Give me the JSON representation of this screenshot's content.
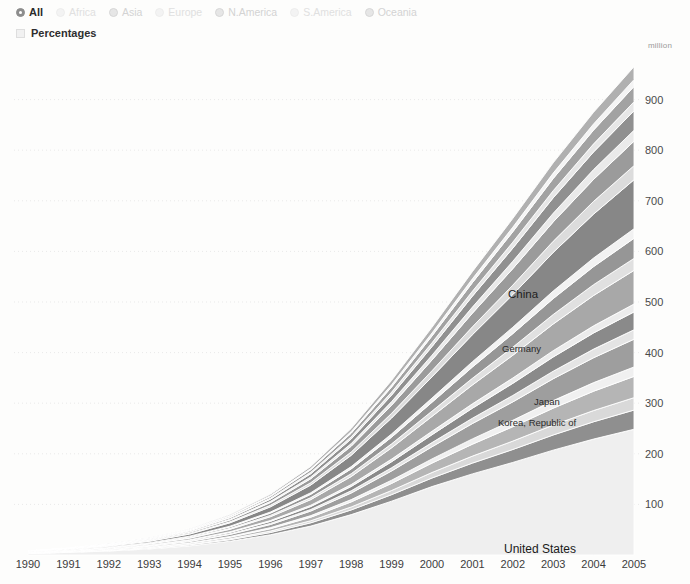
{
  "controls": {
    "regions": [
      {
        "label": "All",
        "selected": true
      },
      {
        "label": "Africa",
        "selected": false
      },
      {
        "label": "Asia",
        "selected": false
      },
      {
        "label": "Europe",
        "selected": false
      },
      {
        "label": "N.America",
        "selected": false
      },
      {
        "label": "S.America",
        "selected": false
      },
      {
        "label": "Oceania",
        "selected": false
      }
    ],
    "percentages": {
      "label": "Percentages",
      "checked": false,
      "icon": "checkbox-icon"
    }
  },
  "chart_data": {
    "type": "area",
    "stacked": true,
    "title": "",
    "xlabel": "",
    "ylabel": "",
    "unit_label": "million",
    "grid": true,
    "legend_position": "in-plot",
    "xlim": [
      1990,
      2005
    ],
    "ylim": [
      0,
      1000
    ],
    "yticks": [
      100,
      200,
      300,
      400,
      500,
      600,
      700,
      800,
      900
    ],
    "x": [
      1990,
      1991,
      1992,
      1993,
      1994,
      1995,
      1996,
      1997,
      1998,
      1999,
      2000,
      2001,
      2002,
      2003,
      2004,
      2005
    ],
    "xticklabels": [
      "1990",
      "1991",
      "1992",
      "1993",
      "1994",
      "1995",
      "1996",
      "1997",
      "1998",
      "1999",
      "2000",
      "2001",
      "2002",
      "2003",
      "2004",
      "2005"
    ],
    "total_values": [
      8,
      14,
      22,
      34,
      52,
      80,
      120,
      175,
      250,
      345,
      450,
      560,
      665,
      775,
      875,
      965
    ],
    "annotations": [
      {
        "text": "China",
        "x": 2002.4,
        "y": 610
      },
      {
        "text": "Germany",
        "x": 2002.2,
        "y": 505
      },
      {
        "text": "Japan",
        "x": 2003.0,
        "y": 403
      },
      {
        "text": "Korea, Republic of",
        "x": 2002.0,
        "y": 362
      },
      {
        "text": "United States",
        "x": 2002.2,
        "y": 115
      }
    ],
    "series": [
      {
        "name": "United States",
        "color": "#efefef",
        "values": [
          3.0,
          5.2,
          8.0,
          12.0,
          18.0,
          27.0,
          39.0,
          55.0,
          76.0,
          99.0,
          124.0,
          143.0,
          161.0,
          180.0,
          198.0,
          213.0
        ]
      },
      {
        "name": "Band-02",
        "color": "#8f8f8f",
        "values": [
          0.3,
          0.5,
          0.8,
          1.2,
          1.9,
          2.9,
          4.3,
          6.2,
          8.8,
          12.0,
          15.5,
          19.0,
          22.5,
          26.0,
          29.5,
          32.5
        ]
      },
      {
        "name": "Band-03",
        "color": "#d9d9d9",
        "values": [
          0.2,
          0.3,
          0.5,
          0.8,
          1.2,
          1.9,
          2.8,
          4.0,
          5.6,
          7.7,
          10.0,
          12.3,
          14.6,
          17.0,
          19.2,
          21.0
        ]
      },
      {
        "name": "Korea, Republic of",
        "color": "#b5b5b5",
        "values": [
          0.3,
          0.5,
          0.8,
          1.3,
          2.0,
          3.1,
          4.6,
          6.7,
          9.5,
          13.0,
          17.0,
          21.0,
          25.0,
          29.0,
          33.0,
          36.0
        ]
      },
      {
        "name": "Band-05",
        "color": "#f0f0f0",
        "values": [
          0.15,
          0.25,
          0.4,
          0.6,
          0.9,
          1.4,
          2.1,
          3.0,
          4.3,
          5.9,
          7.6,
          9.4,
          11.2,
          13.0,
          14.7,
          16.0
        ]
      },
      {
        "name": "Japan",
        "color": "#9e9e9e",
        "values": [
          0.4,
          0.7,
          1.1,
          1.7,
          2.6,
          4.0,
          6.0,
          8.7,
          12.4,
          17.0,
          22.0,
          27.0,
          32.0,
          37.5,
          42.5,
          47.0
        ]
      },
      {
        "name": "Band-07",
        "color": "#e4e4e4",
        "values": [
          0.15,
          0.25,
          0.4,
          0.6,
          0.9,
          1.4,
          2.1,
          3.0,
          4.3,
          5.9,
          7.6,
          9.4,
          11.2,
          13.0,
          14.7,
          16.0
        ]
      },
      {
        "name": "Band-08",
        "color": "#8a8a8a",
        "values": [
          0.25,
          0.45,
          0.7,
          1.1,
          1.7,
          2.6,
          3.9,
          5.6,
          8.0,
          11.0,
          14.2,
          17.6,
          21.0,
          24.4,
          27.6,
          30.2
        ]
      },
      {
        "name": "Band-09",
        "color": "#ececec",
        "values": [
          0.12,
          0.2,
          0.32,
          0.5,
          0.76,
          1.2,
          1.7,
          2.5,
          3.6,
          4.9,
          6.3,
          7.8,
          9.3,
          10.8,
          12.2,
          13.4
        ]
      },
      {
        "name": "Germany",
        "color": "#a8a8a8",
        "values": [
          0.5,
          0.85,
          1.35,
          2.1,
          3.2,
          4.9,
          7.3,
          10.6,
          15.1,
          20.7,
          26.9,
          33.2,
          39.5,
          45.8,
          51.8,
          57.0
        ]
      },
      {
        "name": "Band-11",
        "color": "#e0e0e0",
        "values": [
          0.18,
          0.3,
          0.48,
          0.75,
          1.14,
          1.75,
          2.6,
          3.8,
          5.4,
          7.4,
          9.6,
          11.8,
          14.1,
          16.3,
          18.5,
          20.3
        ]
      },
      {
        "name": "Band-12",
        "color": "#969696",
        "values": [
          0.3,
          0.5,
          0.8,
          1.25,
          1.9,
          2.9,
          4.35,
          6.3,
          9.0,
          12.3,
          16.0,
          19.8,
          23.5,
          27.3,
          30.8,
          34.0
        ]
      },
      {
        "name": "Band-13",
        "color": "#f2f2f2",
        "values": [
          0.14,
          0.24,
          0.38,
          0.6,
          0.9,
          1.4,
          2.1,
          3.0,
          4.3,
          5.9,
          7.6,
          9.4,
          11.2,
          13.0,
          14.7,
          16.2
        ]
      },
      {
        "name": "China",
        "color": "#878787",
        "values": [
          0.6,
          1.05,
          1.7,
          2.7,
          4.2,
          6.6,
          10.0,
          14.7,
          21.2,
          29.3,
          38.4,
          47.6,
          56.8,
          66.2,
          75.0,
          83.0
        ]
      },
      {
        "name": "Band-15",
        "color": "#dcdcdc",
        "values": [
          0.2,
          0.34,
          0.55,
          0.86,
          1.3,
          2.0,
          3.0,
          4.4,
          6.3,
          8.6,
          11.2,
          13.9,
          16.5,
          19.2,
          21.7,
          23.9
        ]
      },
      {
        "name": "Band-16",
        "color": "#9b9b9b",
        "values": [
          0.35,
          0.6,
          0.95,
          1.5,
          2.3,
          3.5,
          5.2,
          7.6,
          10.9,
          14.9,
          19.4,
          24.0,
          28.6,
          33.2,
          37.6,
          41.4
        ]
      },
      {
        "name": "Band-17",
        "color": "#eaeaea",
        "values": [
          0.16,
          0.27,
          0.43,
          0.68,
          1.03,
          1.58,
          2.35,
          3.4,
          4.9,
          6.7,
          8.7,
          10.8,
          12.8,
          14.9,
          16.8,
          18.5
        ]
      },
      {
        "name": "Band-18",
        "color": "#909090",
        "values": [
          0.28,
          0.48,
          0.76,
          1.2,
          1.82,
          2.8,
          4.2,
          6.1,
          8.7,
          11.9,
          15.5,
          19.2,
          22.8,
          26.5,
          30.0,
          33.0
        ]
      },
      {
        "name": "Band-19",
        "color": "#e7e7e7",
        "values": [
          0.13,
          0.22,
          0.35,
          0.55,
          0.84,
          1.3,
          1.92,
          2.8,
          4.0,
          5.5,
          7.1,
          8.8,
          10.5,
          12.2,
          13.8,
          15.2
        ]
      },
      {
        "name": "Band-20",
        "color": "#a2a2a2",
        "values": [
          0.22,
          0.38,
          0.6,
          0.94,
          1.43,
          2.2,
          3.3,
          4.8,
          6.9,
          9.4,
          12.2,
          15.1,
          18.0,
          20.9,
          23.6,
          26.0
        ]
      },
      {
        "name": "Band-21",
        "color": "#f4f4f4",
        "values": [
          0.1,
          0.17,
          0.27,
          0.42,
          0.64,
          0.98,
          1.46,
          2.12,
          3.0,
          4.2,
          5.4,
          6.7,
          8.0,
          9.3,
          10.5,
          11.6
        ]
      },
      {
        "name": "Band-22",
        "color": "#b0b0b0",
        "values": [
          0.19,
          0.32,
          0.51,
          0.8,
          1.22,
          1.87,
          2.8,
          4.05,
          5.8,
          7.9,
          10.3,
          12.7,
          15.1,
          17.6,
          19.9,
          21.9
        ]
      }
    ]
  }
}
